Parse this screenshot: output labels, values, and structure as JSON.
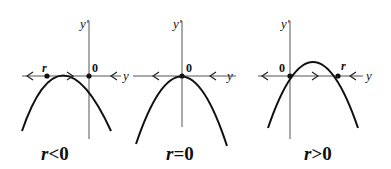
{
  "diagram": {
    "panels": [
      {
        "id": "r-negative",
        "vertical_axis_label": "y'",
        "horizontal_axis_label": "y",
        "equilibria": [
          {
            "label": "r",
            "stability": "unstable"
          },
          {
            "label": "0",
            "stability": "stable"
          }
        ],
        "caption": "r<0",
        "caption_var": "r",
        "caption_rel": "<0"
      },
      {
        "id": "r-zero",
        "vertical_axis_label": "y'",
        "horizontal_axis_label": "y",
        "equilibria": [
          {
            "label": "0",
            "stability": "semi-stable"
          }
        ],
        "caption": "r=0",
        "caption_var": "r",
        "caption_rel": "=0"
      },
      {
        "id": "r-positive",
        "vertical_axis_label": "y'",
        "horizontal_axis_label": "y",
        "equilibria": [
          {
            "label": "0",
            "stability": "unstable"
          },
          {
            "label": "r",
            "stability": "stable"
          }
        ],
        "caption": "r>0",
        "caption_var": "r",
        "caption_rel": ">0"
      }
    ]
  }
}
